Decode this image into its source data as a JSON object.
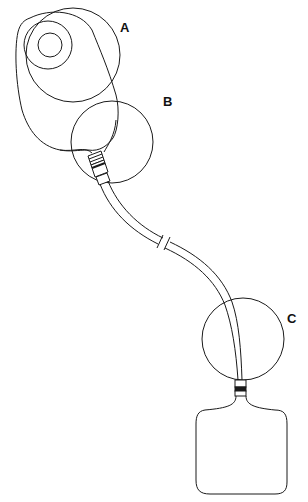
{
  "diagram": {
    "type": "medical-device-illustration",
    "labels": [
      {
        "id": "A",
        "text": "A",
        "x": 120,
        "y": 22
      },
      {
        "id": "B",
        "text": "B",
        "x": 163,
        "y": 95
      },
      {
        "id": "C",
        "text": "C",
        "x": 288,
        "y": 313
      }
    ],
    "components": {
      "pouch": "pouch-with-stoma-flange",
      "connector": "tube-connector",
      "tube": "drainage-tube-with-break",
      "bag": "drainage-bag"
    },
    "colors": {
      "line": "#1a1a1a",
      "background": "#ffffff"
    }
  }
}
